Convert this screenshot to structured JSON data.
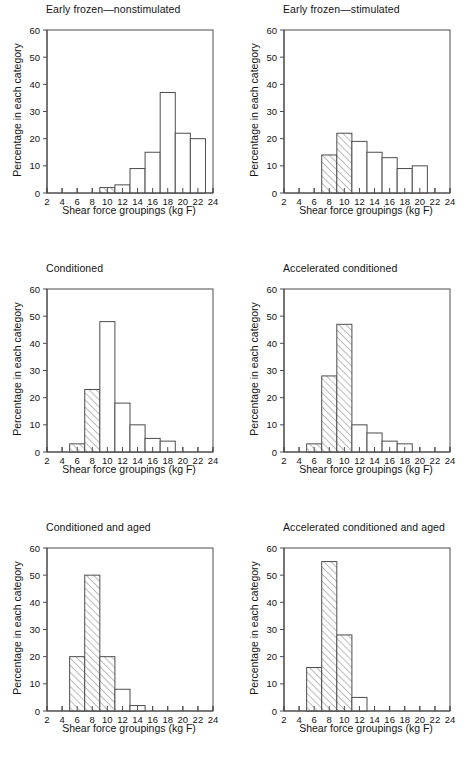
{
  "figure": {
    "axis_labels": {
      "x": "Shear force groupings (kg F)",
      "y": "Percentage in each category"
    },
    "x_ticks": [
      "2",
      "4",
      "6",
      "8",
      "10",
      "12",
      "14",
      "16",
      "18",
      "20",
      "22",
      "24"
    ],
    "y_ticks": [
      "0",
      "10",
      "20",
      "30",
      "40",
      "50",
      "60"
    ],
    "colors": {
      "line": "#4d4d4d",
      "text": "#141414",
      "background": "#ffffff",
      "hatch": "#6b6b6b"
    }
  },
  "chart_data": [
    {
      "type": "bar",
      "title": "Early frozen—nonstimulated",
      "xlabel": "Shear force groupings (kg F)",
      "ylabel": "Percentage in each category",
      "xlim": [
        2,
        24
      ],
      "ylim": [
        0,
        60
      ],
      "grid": false,
      "legend": "none",
      "bin_width": 2,
      "bins": [
        {
          "start": 9,
          "end": 11,
          "value": 2,
          "hatched": true
        },
        {
          "start": 11,
          "end": 13,
          "value": 3,
          "hatched": false
        },
        {
          "start": 13,
          "end": 15,
          "value": 9,
          "hatched": false
        },
        {
          "start": 15,
          "end": 17,
          "value": 15,
          "hatched": false
        },
        {
          "start": 17,
          "end": 19,
          "value": 37,
          "hatched": false
        },
        {
          "start": 19,
          "end": 21,
          "value": 22,
          "hatched": false
        },
        {
          "start": 21,
          "end": 23,
          "value": 20,
          "hatched": false
        }
      ]
    },
    {
      "type": "bar",
      "title": "Early frozen—stimulated",
      "xlabel": "Shear force groupings (kg F)",
      "ylabel": "Percentage in each category",
      "xlim": [
        2,
        24
      ],
      "ylim": [
        0,
        60
      ],
      "grid": false,
      "legend": "none",
      "bin_width": 2,
      "bins": [
        {
          "start": 7,
          "end": 9,
          "value": 14,
          "hatched": true
        },
        {
          "start": 9,
          "end": 11,
          "value": 22,
          "hatched": true
        },
        {
          "start": 11,
          "end": 13,
          "value": 19,
          "hatched": false
        },
        {
          "start": 13,
          "end": 15,
          "value": 15,
          "hatched": false
        },
        {
          "start": 15,
          "end": 17,
          "value": 13,
          "hatched": false
        },
        {
          "start": 17,
          "end": 19,
          "value": 9,
          "hatched": false
        },
        {
          "start": 19,
          "end": 21,
          "value": 10,
          "hatched": false
        }
      ]
    },
    {
      "type": "bar",
      "title": "Conditioned",
      "xlabel": "Shear force groupings (kg F)",
      "ylabel": "Percentage in each category",
      "xlim": [
        2,
        24
      ],
      "ylim": [
        0,
        60
      ],
      "grid": false,
      "legend": "none",
      "bin_width": 2,
      "bins": [
        {
          "start": 5,
          "end": 7,
          "value": 3,
          "hatched": true
        },
        {
          "start": 7,
          "end": 9,
          "value": 23,
          "hatched": true
        },
        {
          "start": 9,
          "end": 11,
          "value": 48,
          "hatched": false
        },
        {
          "start": 11,
          "end": 13,
          "value": 18,
          "hatched": false
        },
        {
          "start": 13,
          "end": 15,
          "value": 10,
          "hatched": false
        },
        {
          "start": 15,
          "end": 17,
          "value": 5,
          "hatched": false
        },
        {
          "start": 17,
          "end": 19,
          "value": 4,
          "hatched": false
        }
      ]
    },
    {
      "type": "bar",
      "title": "Accelerated conditioned",
      "xlabel": "Shear force groupings (kg F)",
      "ylabel": "Percentage in each category",
      "xlim": [
        2,
        24
      ],
      "ylim": [
        0,
        60
      ],
      "grid": false,
      "legend": "none",
      "bin_width": 2,
      "bins": [
        {
          "start": 5,
          "end": 7,
          "value": 3,
          "hatched": true
        },
        {
          "start": 7,
          "end": 9,
          "value": 28,
          "hatched": true
        },
        {
          "start": 9,
          "end": 11,
          "value": 47,
          "hatched": true
        },
        {
          "start": 11,
          "end": 13,
          "value": 10,
          "hatched": false
        },
        {
          "start": 13,
          "end": 15,
          "value": 7,
          "hatched": false
        },
        {
          "start": 15,
          "end": 17,
          "value": 4,
          "hatched": false
        },
        {
          "start": 17,
          "end": 19,
          "value": 3,
          "hatched": false
        }
      ]
    },
    {
      "type": "bar",
      "title": "Conditioned and aged",
      "xlabel": "Shear force groupings (kg F)",
      "ylabel": "Percentage in each category",
      "xlim": [
        2,
        24
      ],
      "ylim": [
        0,
        60
      ],
      "grid": false,
      "legend": "none",
      "bin_width": 2,
      "bins": [
        {
          "start": 5,
          "end": 7,
          "value": 20,
          "hatched": true
        },
        {
          "start": 7,
          "end": 9,
          "value": 50,
          "hatched": true
        },
        {
          "start": 9,
          "end": 11,
          "value": 20,
          "hatched": true
        },
        {
          "start": 11,
          "end": 13,
          "value": 8,
          "hatched": false
        },
        {
          "start": 13,
          "end": 15,
          "value": 2,
          "hatched": false
        }
      ]
    },
    {
      "type": "bar",
      "title": "Accelerated conditioned and aged",
      "xlabel": "Shear force groupings (kg F)",
      "ylabel": "Percentage in each category",
      "xlim": [
        2,
        24
      ],
      "ylim": [
        0,
        60
      ],
      "grid": false,
      "legend": "none",
      "bin_width": 2,
      "bins": [
        {
          "start": 5,
          "end": 7,
          "value": 16,
          "hatched": true
        },
        {
          "start": 7,
          "end": 9,
          "value": 55,
          "hatched": true
        },
        {
          "start": 9,
          "end": 11,
          "value": 28,
          "hatched": true
        },
        {
          "start": 11,
          "end": 13,
          "value": 5,
          "hatched": false
        }
      ]
    }
  ]
}
